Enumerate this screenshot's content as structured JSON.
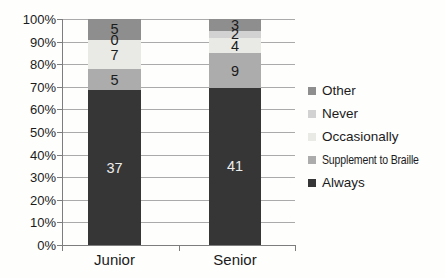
{
  "chart_data": {
    "type": "bar",
    "subtype": "100-percent-stacked-column",
    "title": "",
    "categories": [
      "Junior",
      "Senior"
    ],
    "series": [
      {
        "name": "Always",
        "values": [
          37,
          41
        ],
        "color": "#363636",
        "label_color": "#ededed"
      },
      {
        "name": "Supplement to Braille",
        "values": [
          5,
          9
        ],
        "color": "#acacac",
        "label_color": "#1b1b1b"
      },
      {
        "name": "Occasionally",
        "values": [
          7,
          4
        ],
        "color": "#e9e9e6",
        "label_color": "#1b1b1b"
      },
      {
        "name": "Never",
        "values": [
          0,
          2
        ],
        "color": "#d2d2d2",
        "label_color": "#1b1b1b"
      },
      {
        "name": "Other",
        "values": [
          5,
          3
        ],
        "color": "#8e8e8e",
        "label_color": "#1b1b1b"
      }
    ],
    "data_labels": true,
    "y_axis": {
      "min": 0,
      "max": 100,
      "step": 10,
      "tick_labels": [
        "0%",
        "10%",
        "20%",
        "30%",
        "40%",
        "50%",
        "60%",
        "70%",
        "80%",
        "90%",
        "100%"
      ]
    },
    "gridlines": true,
    "legend": {
      "position": "right",
      "entries": [
        "Other",
        "Never",
        "Occasionally",
        "Supplement to Braille",
        "Always"
      ]
    }
  },
  "colors": {
    "background": "#fefefd",
    "gridline": "#aaaaaa",
    "axis": "#7d7d7d",
    "text": "#1b1b1b"
  }
}
